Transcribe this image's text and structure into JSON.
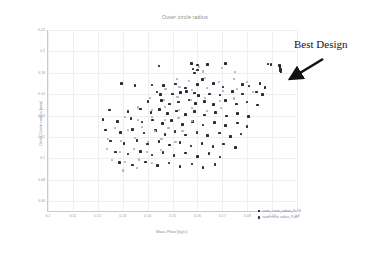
{
  "chart_data": {
    "type": "scatter",
    "title": "Outer circle radius",
    "xlabel": "Mass Flow [kg/s]",
    "ylabel": "Outer Circle radius [mm]",
    "xlim": [
      0.1,
      0.2
    ],
    "ylim": [
      0.05,
      0.22
    ],
    "xticks": [
      "0.1",
      "0.11",
      "0.12",
      "0.13",
      "0.14",
      "0.15",
      "0.16",
      "0.17",
      "0.18",
      "0.19",
      "0.2"
    ],
    "yticks": [
      "0.22",
      "0.2",
      "0.18",
      "0.16",
      "0.14",
      "0.12",
      "0.1",
      "0.08",
      "0.06"
    ],
    "grid": true,
    "legend_position": "bottom-right",
    "series": [
      {
        "name": "outer_circle_radius_P=18",
        "color": "#2b2b33",
        "points": [
          [
            0.1445,
            0.1862
          ],
          [
            0.1576,
            0.1889
          ],
          [
            0.16,
            0.1872
          ],
          [
            0.1641,
            0.1878
          ],
          [
            0.1713,
            0.1889
          ],
          [
            0.1582,
            0.1835
          ],
          [
            0.1601,
            0.1826
          ],
          [
            0.1588,
            0.1799
          ],
          [
            0.1884,
            0.1882
          ],
          [
            0.1896,
            0.1878
          ],
          [
            0.193,
            0.1866
          ],
          [
            0.1932,
            0.1848
          ],
          [
            0.1933,
            0.1834
          ],
          [
            0.1934,
            0.182
          ],
          [
            0.1936,
            0.1806
          ],
          [
            0.1295,
            0.17
          ],
          [
            0.1349,
            0.1682
          ],
          [
            0.1417,
            0.1688
          ],
          [
            0.1463,
            0.168
          ],
          [
            0.1513,
            0.1696
          ],
          [
            0.1552,
            0.166
          ],
          [
            0.16,
            0.1689
          ],
          [
            0.162,
            0.1736
          ],
          [
            0.1664,
            0.17
          ],
          [
            0.1702,
            0.1666
          ],
          [
            0.178,
            0.1692
          ],
          [
            0.1808,
            0.1678
          ],
          [
            0.1851,
            0.1701
          ],
          [
            0.1871,
            0.1662
          ],
          [
            0.1438,
            0.162
          ],
          [
            0.1452,
            0.1596
          ],
          [
            0.15,
            0.1604
          ],
          [
            0.1533,
            0.1617
          ],
          [
            0.1557,
            0.1625
          ],
          [
            0.1589,
            0.1612
          ],
          [
            0.1604,
            0.1588
          ],
          [
            0.1648,
            0.1601
          ],
          [
            0.169,
            0.1594
          ],
          [
            0.1741,
            0.1628
          ],
          [
            0.178,
            0.1602
          ],
          [
            0.1837,
            0.162
          ],
          [
            0.1862,
            0.1596
          ],
          [
            0.1402,
            0.1532
          ],
          [
            0.1455,
            0.1541
          ],
          [
            0.1489,
            0.151
          ],
          [
            0.1523,
            0.1528
          ],
          [
            0.1566,
            0.1546
          ],
          [
            0.1593,
            0.1514
          ],
          [
            0.1629,
            0.1533
          ],
          [
            0.1664,
            0.1505
          ],
          [
            0.1713,
            0.154
          ],
          [
            0.1758,
            0.1509
          ],
          [
            0.18,
            0.1528
          ],
          [
            0.1841,
            0.1498
          ],
          [
            0.1247,
            0.1452
          ],
          [
            0.1322,
            0.1441
          ],
          [
            0.1371,
            0.1462
          ],
          [
            0.1414,
            0.143
          ],
          [
            0.1448,
            0.1455
          ],
          [
            0.148,
            0.142
          ],
          [
            0.1516,
            0.1444
          ],
          [
            0.1553,
            0.1412
          ],
          [
            0.1588,
            0.1436
          ],
          [
            0.1629,
            0.1405
          ],
          [
            0.1672,
            0.1429
          ],
          [
            0.1718,
            0.1398
          ],
          [
            0.1762,
            0.1422
          ],
          [
            0.1806,
            0.139
          ],
          [
            0.1221,
            0.1366
          ],
          [
            0.128,
            0.1344
          ],
          [
            0.1334,
            0.1372
          ],
          [
            0.1378,
            0.134
          ],
          [
            0.142,
            0.136
          ],
          [
            0.1459,
            0.1328
          ],
          [
            0.1497,
            0.1352
          ],
          [
            0.154,
            0.132
          ],
          [
            0.158,
            0.1345
          ],
          [
            0.1622,
            0.1312
          ],
          [
            0.1668,
            0.1338
          ],
          [
            0.1714,
            0.1306
          ],
          [
            0.176,
            0.133
          ],
          [
            0.18,
            0.1298
          ],
          [
            0.1232,
            0.1265
          ],
          [
            0.129,
            0.124
          ],
          [
            0.134,
            0.1272
          ],
          [
            0.1385,
            0.1238
          ],
          [
            0.1432,
            0.126
          ],
          [
            0.147,
            0.1226
          ],
          [
            0.151,
            0.1252
          ],
          [
            0.1552,
            0.122
          ],
          [
            0.1598,
            0.1244
          ],
          [
            0.164,
            0.1212
          ],
          [
            0.1688,
            0.1238
          ],
          [
            0.1732,
            0.1205
          ],
          [
            0.1775,
            0.123
          ],
          [
            0.1252,
            0.1162
          ],
          [
            0.1305,
            0.114
          ],
          [
            0.1358,
            0.1168
          ],
          [
            0.14,
            0.1134
          ],
          [
            0.1446,
            0.1158
          ],
          [
            0.1488,
            0.1126
          ],
          [
            0.153,
            0.115
          ],
          [
            0.1574,
            0.1118
          ],
          [
            0.1618,
            0.1142
          ],
          [
            0.1662,
            0.111
          ],
          [
            0.1706,
            0.1136
          ],
          [
            0.1752,
            0.1104
          ],
          [
            0.127,
            0.1062
          ],
          [
            0.1322,
            0.104
          ],
          [
            0.1372,
            0.1066
          ],
          [
            0.1418,
            0.1034
          ],
          [
            0.1462,
            0.1058
          ],
          [
            0.1506,
            0.1026
          ],
          [
            0.1552,
            0.105
          ],
          [
            0.16,
            0.1018
          ],
          [
            0.1646,
            0.1044
          ],
          [
            0.169,
            0.1012
          ],
          [
            0.1288,
            0.0962
          ],
          [
            0.134,
            0.094
          ],
          [
            0.1392,
            0.0968
          ],
          [
            0.144,
            0.0934
          ],
          [
            0.1486,
            0.0958
          ],
          [
            0.153,
            0.0926
          ],
          [
            0.1578,
            0.095
          ],
          [
            0.1622,
            0.0918
          ],
          [
            0.167,
            0.0944
          ]
        ]
      },
      {
        "name": "outer circle radius_P=47",
        "color": "#b4b4c0",
        "points": [
          [
            0.1608,
            0.1852
          ],
          [
            0.1622,
            0.1812
          ],
          [
            0.17,
            0.1842
          ],
          [
            0.1752,
            0.1808
          ],
          [
            0.1518,
            0.1744
          ],
          [
            0.1565,
            0.1724
          ],
          [
            0.1632,
            0.1752
          ],
          [
            0.1688,
            0.1718
          ],
          [
            0.1746,
            0.174
          ],
          [
            0.1798,
            0.1712
          ],
          [
            0.1472,
            0.1648
          ],
          [
            0.1528,
            0.1668
          ],
          [
            0.158,
            0.1638
          ],
          [
            0.164,
            0.166
          ],
          [
            0.1702,
            0.163
          ],
          [
            0.176,
            0.1652
          ],
          [
            0.1822,
            0.1622
          ],
          [
            0.141,
            0.1566
          ],
          [
            0.1466,
            0.1548
          ],
          [
            0.152,
            0.1572
          ],
          [
            0.1576,
            0.1542
          ],
          [
            0.1632,
            0.1566
          ],
          [
            0.169,
            0.1536
          ],
          [
            0.1748,
            0.156
          ],
          [
            0.1362,
            0.1476
          ],
          [
            0.1418,
            0.1456
          ],
          [
            0.147,
            0.1482
          ],
          [
            0.1526,
            0.145
          ],
          [
            0.158,
            0.1474
          ],
          [
            0.1638,
            0.1444
          ],
          [
            0.1696,
            0.1468
          ],
          [
            0.1308,
            0.1386
          ],
          [
            0.1362,
            0.1362
          ],
          [
            0.1416,
            0.139
          ],
          [
            0.147,
            0.1358
          ],
          [
            0.1524,
            0.1382
          ],
          [
            0.158,
            0.1352
          ],
          [
            0.1268,
            0.1288
          ],
          [
            0.1322,
            0.1266
          ],
          [
            0.1376,
            0.1292
          ],
          [
            0.143,
            0.126
          ],
          [
            0.1484,
            0.1284
          ],
          [
            0.154,
            0.1254
          ],
          [
            0.124,
            0.1186
          ],
          [
            0.1294,
            0.1164
          ],
          [
            0.1348,
            0.119
          ],
          [
            0.1402,
            0.1158
          ],
          [
            0.1456,
            0.1182
          ],
          [
            0.1512,
            0.1152
          ],
          [
            0.1236,
            0.1086
          ],
          [
            0.129,
            0.1064
          ],
          [
            0.1344,
            0.109
          ],
          [
            0.1398,
            0.1058
          ],
          [
            0.1452,
            0.1082
          ],
          [
            0.1256,
            0.0986
          ],
          [
            0.131,
            0.0964
          ],
          [
            0.1364,
            0.099
          ],
          [
            0.1418,
            0.0958
          ],
          [
            0.13,
            0.0888
          ],
          [
            0.1356,
            0.091
          ]
        ]
      }
    ],
    "annotations": [
      {
        "text": "Best Design",
        "target_x": 0.1934,
        "target_y": 0.184
      }
    ]
  }
}
